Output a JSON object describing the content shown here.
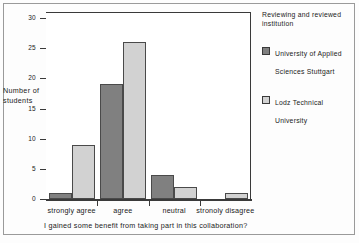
{
  "chart_data": {
    "type": "bar",
    "title": "",
    "subtitle": "",
    "xlabel": "I gained some benefit from taking part in this collaboration?",
    "ylabel": "Number of students",
    "categories": [
      "strongly agree",
      "agree",
      "neutral",
      "stronoly disagree"
    ],
    "series": [
      {
        "name": "University of Applied Sciences Stuttgart",
        "color": "#808080",
        "values": [
          1,
          19,
          4,
          0
        ]
      },
      {
        "name": "Lodz Technical University",
        "color": "#d2d2d2",
        "values": [
          9,
          26,
          2,
          1
        ]
      }
    ],
    "ylim": [
      0,
      31
    ],
    "yticks": [
      0,
      5,
      10,
      15,
      20,
      25,
      30
    ],
    "ytick_labels": [
      "0",
      "5",
      "10",
      "15",
      "20",
      "25",
      "30"
    ],
    "grid": false,
    "legend_position": "right"
  },
  "legend": {
    "title": "Reviewing and reviewed institution",
    "entries": [
      {
        "label": "University of Applied Sciences Stuttgart",
        "color": "#808080"
      },
      {
        "label": "Lodz Technical University",
        "color": "#d2d2d2"
      }
    ]
  },
  "axes": {
    "y_title": "Number of students",
    "x_caption": "I gained some benefit from taking part in this collaboration?"
  }
}
